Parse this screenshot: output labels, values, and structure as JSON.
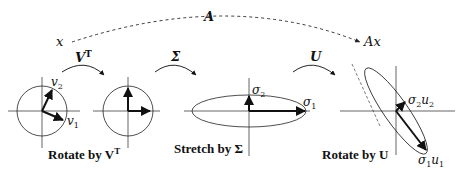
{
  "diagram": {
    "overall_map": {
      "from": "x",
      "to": "Ax",
      "label": "A"
    },
    "transforms": [
      {
        "label": "V",
        "sup": "T"
      },
      {
        "label": "Σ"
      },
      {
        "label": "U"
      }
    ],
    "panels": [
      {
        "caption": "Rotate by V",
        "caption_sup": "T",
        "vectors": [
          {
            "label": "v",
            "sub": "1"
          },
          {
            "label": "v",
            "sub": "2"
          }
        ]
      },
      {
        "caption": "",
        "vectors": []
      },
      {
        "caption": "Stretch by Σ",
        "vectors": [
          {
            "label": "σ",
            "sub": "1"
          },
          {
            "label": "σ",
            "sub": "2"
          }
        ]
      },
      {
        "caption": "Rotate by U",
        "vectors": [
          {
            "label": "σ",
            "sub": "1",
            "tail": "u",
            "tail_sub": "1"
          },
          {
            "label": "σ",
            "sub": "2",
            "tail": "u",
            "tail_sub": "2"
          }
        ]
      }
    ]
  }
}
